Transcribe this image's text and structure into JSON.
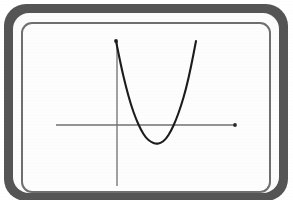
{
  "figure": {
    "title": "",
    "frame_style": "rounded-screen-bezel",
    "bezel_color": "#555555",
    "inner_border_color": "#6f6f6f",
    "screen_background": "#fdfdfd"
  },
  "chart_data": {
    "type": "line",
    "title": "",
    "subtitle": "",
    "xlabel": "",
    "ylabel": "",
    "grid": false,
    "legend": false,
    "axis_color": "#707070",
    "curve_color": "#1c1c1c",
    "curve_width_px": 2.1,
    "axis_width_px": 1.3,
    "axes": {
      "x_axis": {
        "y_pixel": 125,
        "x_start_pixel": 56,
        "x_end_pixel": 236,
        "end_marker": "dot",
        "start_marker": "none"
      },
      "y_axis": {
        "x_pixel": 117,
        "y_start_pixel": 41,
        "y_end_pixel": 186,
        "top_marker": "dot",
        "bottom_marker": "none"
      },
      "origin_pixel": [
        117,
        125
      ]
    },
    "series": [
      {
        "name": "parabola",
        "shape": "quadratic",
        "opens": "up",
        "vertex_pixel": [
          156,
          144
        ],
        "left_endpoint_pixel": [
          116,
          41
        ],
        "right_endpoint_pixel": [
          196,
          41
        ],
        "x_intercepts_pixel": [
          136,
          176
        ],
        "points_pixel": [
          [
            116,
            41
          ],
          [
            121,
            66
          ],
          [
            126,
            87
          ],
          [
            131,
            105
          ],
          [
            136,
            119
          ],
          [
            141,
            130
          ],
          [
            146,
            138
          ],
          [
            151,
            142
          ],
          [
            156,
            144
          ],
          [
            161,
            143
          ],
          [
            166,
            139
          ],
          [
            171,
            131
          ],
          [
            176,
            120
          ],
          [
            181,
            106
          ],
          [
            186,
            89
          ],
          [
            191,
            67
          ],
          [
            196,
            41
          ]
        ]
      }
    ],
    "xlim": [
      56,
      236
    ],
    "ylim": [
      186,
      41
    ],
    "tick_labels_x": [],
    "tick_labels_y": [],
    "annotations": []
  }
}
